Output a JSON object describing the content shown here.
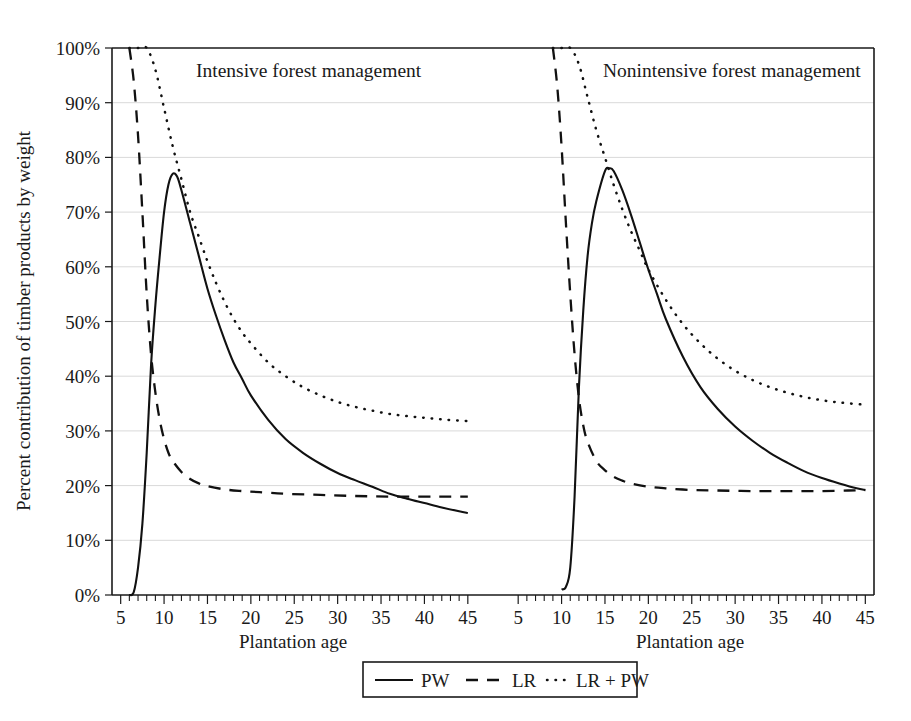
{
  "figure": {
    "y_axis_title": "Percent contribution of timber products by weight",
    "x_axis_title_left": "Plantation age",
    "x_axis_title_right": "Plantation age",
    "panel_left_title": "Intensive forest management",
    "panel_right_title": "Nonintensive forest management"
  },
  "legend": {
    "items": [
      {
        "label": "PW",
        "style": "solid"
      },
      {
        "label": "LR",
        "style": "dashed"
      },
      {
        "label": "LR + PW",
        "style": "dotted"
      }
    ]
  },
  "chart_data": {
    "type": "line",
    "title": "",
    "subtitle": "",
    "xlabel": "Plantation age",
    "ylabel": "Percent contribution of timber products by weight",
    "xlim": [
      4,
      46
    ],
    "ylim": [
      0,
      100
    ],
    "grid": true,
    "legend_position": "bottom-center",
    "y_ticks": [
      0,
      10,
      20,
      30,
      40,
      50,
      60,
      70,
      80,
      90,
      100
    ],
    "y_tick_labels": [
      "0%",
      "10%",
      "20%",
      "30%",
      "40%",
      "50%",
      "60%",
      "70%",
      "80%",
      "90%",
      "100%"
    ],
    "x_ticks": [
      5,
      10,
      15,
      20,
      25,
      30,
      35,
      40,
      45
    ],
    "x_tick_labels": [
      "5",
      "10",
      "15",
      "20",
      "25",
      "30",
      "35",
      "40",
      "45"
    ],
    "x_minor_tick_step": 1,
    "panels": [
      {
        "name": "Intensive forest management",
        "series": [
          {
            "name": "PW",
            "style": "solid",
            "x": [
              6,
              6.5,
              7,
              7.5,
              8,
              8.5,
              9,
              9.5,
              10,
              10.5,
              11,
              11.5,
              12,
              13,
              14,
              15,
              16,
              17,
              18,
              19,
              20,
              22,
              24,
              26,
              28,
              30,
              32,
              34,
              36,
              38,
              40,
              42,
              44,
              45
            ],
            "y": [
              0,
              0.5,
              5,
              13,
              26,
              42,
              53,
              62,
              70,
              75,
              77,
              76.5,
              74,
              68,
              62,
              56,
              51,
              46.5,
              42.5,
              39.5,
              36.5,
              32,
              28.5,
              26,
              24,
              22.3,
              21,
              19.8,
              18.5,
              17.6,
              16.8,
              16,
              15.3,
              15
            ]
          },
          {
            "name": "LR",
            "style": "dashed",
            "x": [
              6,
              6.5,
              7,
              7.5,
              8,
              8.5,
              9,
              9.5,
              10,
              10.5,
              11,
              12,
              13,
              14,
              15,
              17,
              19,
              21,
              24,
              28,
              32,
              36,
              40,
              43,
              45
            ],
            "y": [
              100,
              94,
              84,
              70,
              55,
              44,
              37,
              32,
              28.5,
              26,
              24.5,
              22.5,
              21.2,
              20.4,
              19.9,
              19.3,
              19,
              18.8,
              18.5,
              18.3,
              18.1,
              18.0,
              18.0,
              18.0,
              18.0
            ]
          },
          {
            "name": "LR + PW",
            "style": "dotted",
            "x": [
              6,
              7,
              8,
              9,
              10,
              11,
              12,
              13,
              14,
              15,
              16,
              17,
              18,
              19,
              20,
              22,
              24,
              26,
              28,
              30,
              32,
              34,
              36,
              38,
              40,
              42,
              44,
              45
            ],
            "y": [
              100,
              100,
              100,
              96,
              89,
              82,
              76,
              70,
              65.5,
              61,
              57,
              53.5,
              50.5,
              48,
              46,
              42.5,
              40,
              38,
              36.5,
              35.3,
              34.4,
              33.7,
              33.1,
              32.7,
              32.4,
              32.1,
              31.9,
              31.8
            ]
          }
        ]
      },
      {
        "name": "Nonintensive forest management",
        "series": [
          {
            "name": "PW",
            "style": "solid",
            "x": [
              10,
              10.5,
              11,
              11.5,
              12,
              12.5,
              13,
              13.5,
              14,
              15,
              15.5,
              16,
              17,
              18,
              19,
              20,
              21,
              22,
              24,
              26,
              28,
              30,
              32,
              34,
              36,
              38,
              40,
              42,
              44,
              45
            ],
            "y": [
              1,
              1.5,
              5,
              18,
              38,
              52,
              62,
              68,
              72,
              77.5,
              78,
              77.5,
              74,
              69.5,
              64.5,
              59.5,
              55,
              50.5,
              43.5,
              38,
              34,
              30.8,
              28.2,
              26,
              24.2,
              22.6,
              21.4,
              20.4,
              19.5,
              19.2
            ]
          },
          {
            "name": "LR",
            "style": "dashed",
            "x": [
              9,
              9.5,
              10,
              10.5,
              11,
              11.5,
              12,
              12.5,
              13,
              14,
              15,
              16,
              17,
              18,
              20,
              22,
              25,
              28,
              32,
              36,
              40,
              43,
              45
            ],
            "y": [
              100,
              93,
              82,
              68,
              55,
              44,
              36,
              31,
              28,
              24.5,
              22.8,
              21.6,
              20.9,
              20.4,
              19.8,
              19.5,
              19.2,
              19.1,
              19.0,
              19.0,
              19.0,
              19.1,
              19.2
            ]
          },
          {
            "name": "LR + PW",
            "style": "dotted",
            "x": [
              9,
              10,
              11,
              12,
              13,
              14,
              15,
              16,
              17,
              18,
              19,
              20,
              22,
              24,
              26,
              28,
              30,
              32,
              34,
              36,
              38,
              40,
              42,
              44,
              45
            ],
            "y": [
              100,
              100,
              100,
              97,
              91,
              85,
              80,
              75,
              70.5,
              66.5,
              63,
              59.5,
              54,
              49.5,
              46,
              43.2,
              41,
              39.3,
              38,
              37,
              36.2,
              35.6,
              35.2,
              34.9,
              34.8
            ]
          }
        ]
      }
    ]
  }
}
